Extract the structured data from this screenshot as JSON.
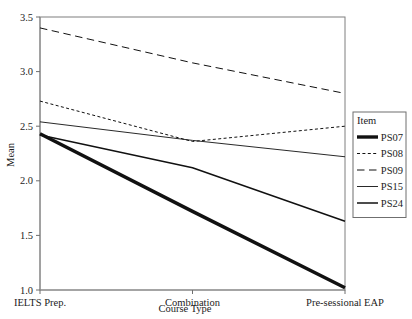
{
  "chart_data": {
    "type": "line",
    "title": "",
    "xlabel": "Course Type",
    "ylabel": "Mean",
    "categories": [
      "IELTS Prep.",
      "Combination",
      "Pre-sessional EAP"
    ],
    "ylim": [
      1.0,
      3.5
    ],
    "yticks": [
      "1.0",
      "1.5",
      "2.0",
      "2.5",
      "3.0",
      "3.5"
    ],
    "ytick_values": [
      1.0,
      1.5,
      2.0,
      2.5,
      3.0,
      3.5
    ],
    "grid": false,
    "legend_position": "right",
    "legend_title": "Item",
    "series": [
      {
        "name": "PS07",
        "values": [
          2.43,
          1.72,
          1.02
        ],
        "style": "solid",
        "width": 3.4
      },
      {
        "name": "PS08",
        "values": [
          2.73,
          2.36,
          2.5
        ],
        "style": "dotted",
        "width": 1.0
      },
      {
        "name": "PS09",
        "values": [
          3.4,
          3.08,
          2.8
        ],
        "style": "dashed",
        "width": 1.0
      },
      {
        "name": "PS15",
        "values": [
          2.54,
          2.37,
          2.22
        ],
        "style": "solid",
        "width": 0.9
      },
      {
        "name": "PS24",
        "values": [
          2.42,
          2.12,
          1.63
        ],
        "style": "solid",
        "width": 1.5
      }
    ]
  },
  "legend": {
    "title": "Item",
    "entries": [
      "PS07",
      "PS08",
      "PS09",
      "PS15",
      "PS24"
    ]
  },
  "axes": {
    "y_label": "Mean",
    "x_label": "Course Type"
  },
  "colors": {
    "line": "#111111",
    "frame": "#7f7f7f",
    "text": "#1c1c1c",
    "background": "#ffffff"
  }
}
